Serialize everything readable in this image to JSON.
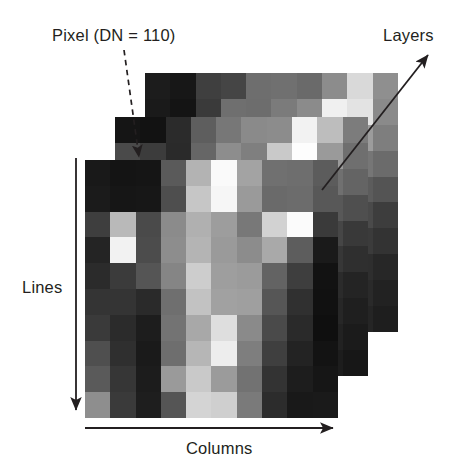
{
  "figure": {
    "type": "diagram",
    "background_color": "#ffffff",
    "text_color": "#231f20"
  },
  "labels": {
    "pixel": "Pixel (DN = 110)",
    "layers": "Layers",
    "lines": "Lines",
    "columns": "Columns"
  },
  "annotations": [
    {
      "name": "pixel-callout",
      "label": "Pixel (DN = 110)",
      "style": "dashed-arrow",
      "from": [
        124,
        50
      ],
      "to": [
        141,
        166
      ],
      "color": "#231f20"
    },
    {
      "name": "layers-callout",
      "label": "Layers",
      "style": "solid-double-arrow",
      "from": [
        322,
        189
      ],
      "to": [
        432,
        52
      ],
      "color": "#231f20"
    },
    {
      "name": "lines-axis",
      "label": "Lines",
      "style": "solid-arrow-down",
      "from": [
        76,
        159
      ],
      "to": [
        76,
        414
      ],
      "color": "#231f20"
    },
    {
      "name": "columns-axis",
      "label": "Columns",
      "style": "solid-arrow-right",
      "from": [
        85,
        428
      ],
      "to": [
        338,
        428
      ],
      "color": "#231f20"
    }
  ],
  "stack": {
    "layer_count": 3,
    "offset_x": -30,
    "offset_y": 43,
    "grid": {
      "rows": 10,
      "cols": 10
    },
    "cell_size_px": 25.3,
    "layers": [
      {
        "name": "layer-back",
        "z": 1,
        "rows": [
          [
            "#1c1c1c",
            "#171717",
            "#3f3f3f",
            "#454545",
            "#6e6e6e",
            "#707070",
            "#6a6a6a",
            "#8c8c8c",
            "#d9d9d9",
            "#8f8f8f"
          ],
          [
            "#1a1a1a",
            "#141414",
            "#3a3a3a",
            "#6f6f6f",
            "#6d6d6d",
            "#7b7b7b",
            "#8b8b8b",
            "#f0f0f0",
            "#e3e3e3",
            "#8a8a8a"
          ],
          [
            "#4a4a4a",
            "#3b3b3b",
            "#2f2f2f",
            "#6b6b6b",
            "#8e8e8e",
            "#7a7a7a",
            "#b5b5b5",
            "#fbfbfb",
            "#9c9c9c",
            "#7e7e7e"
          ],
          [
            "#3b3b3b",
            "#2e2e2e",
            "#555555",
            "#6a6a6a",
            "#8d8d8d",
            "#a6a6a6",
            "#9b9b9b",
            "#8e8e8e",
            "#767676",
            "#6b6b6b"
          ],
          [
            "#2a2a2a",
            "#3f3f3f",
            "#686868",
            "#8a8a8a",
            "#9e9e9e",
            "#b2b2b2",
            "#7d7d7d",
            "#6e6e6e",
            "#5c5c5c",
            "#545454"
          ],
          [
            "#1f1f1f",
            "#343434",
            "#5a5a5a",
            "#7d7d7d",
            "#a9a9a9",
            "#8e8e8e",
            "#6b6b6b",
            "#585858",
            "#4a4a4a",
            "#3d3d3d"
          ],
          [
            "#2d2d2d",
            "#4a4a4a",
            "#6d6d6d",
            "#8f8f8f",
            "#9a9a9a",
            "#7c7c7c",
            "#5e5e5e",
            "#4d4d4d",
            "#3b3b3b",
            "#333333"
          ],
          [
            "#3a3a3a",
            "#5c5c5c",
            "#7e7e7e",
            "#a0a0a0",
            "#8c8c8c",
            "#6a6a6a",
            "#4f4f4f",
            "#404040",
            "#2e2e2e",
            "#272727"
          ],
          [
            "#4d4d4d",
            "#6f6f6f",
            "#8b8b8b",
            "#959595",
            "#7a7a7a",
            "#5b5b5b",
            "#454545",
            "#373737",
            "#2a2a2a",
            "#222222"
          ],
          [
            "#5e5e5e",
            "#7d7d7d",
            "#969696",
            "#868686",
            "#6b6b6b",
            "#4e4e4e",
            "#3c3c3c",
            "#2f2f2f",
            "#252525",
            "#1e1e1e"
          ]
        ]
      },
      {
        "name": "layer-mid",
        "z": 2,
        "rows": [
          [
            "#151515",
            "#121212",
            "#2b2b2b",
            "#5e5e5e",
            "#777777",
            "#8a8a8a",
            "#8c8c8c",
            "#f2f2f2",
            "#bdbdbd",
            "#7c7c7c"
          ],
          [
            "#4a4a4a",
            "#3c3c3c",
            "#2a2a2a",
            "#666666",
            "#8d8d8d",
            "#7f7f7f",
            "#c9c9c9",
            "#fdfdfd",
            "#9a9a9a",
            "#6f6f6f"
          ],
          [
            "#3e3e3e",
            "#333333",
            "#4f4f4f",
            "#707070",
            "#949494",
            "#a8a8a8",
            "#8e8e8e",
            "#8a8a8a",
            "#707070",
            "#646464"
          ],
          [
            "#2c2c2c",
            "#414141",
            "#6b6b6b",
            "#8f8f8f",
            "#a2a2a2",
            "#b6b6b6",
            "#7a7a7a",
            "#6a6a6a",
            "#585858",
            "#4f4f4f"
          ],
          [
            "#212121",
            "#363636",
            "#5d5d5d",
            "#808080",
            "#adadad",
            "#919191",
            "#696969",
            "#555555",
            "#464646",
            "#393939"
          ],
          [
            "#2f2f2f",
            "#4d4d4d",
            "#707070",
            "#929292",
            "#9d9d9d",
            "#7f7f7f",
            "#5b5b5b",
            "#4a4a4a",
            "#373737",
            "#2f2f2f"
          ],
          [
            "#3c3c3c",
            "#5f5f5f",
            "#818181",
            "#a3a3a3",
            "#8f8f8f",
            "#6d6d6d",
            "#4c4c4c",
            "#3d3d3d",
            "#2b2b2b",
            "#242424"
          ],
          [
            "#4f4f4f",
            "#727272",
            "#8e8e8e",
            "#989898",
            "#7d7d7d",
            "#5e5e5e",
            "#424242",
            "#343434",
            "#272727",
            "#1f1f1f"
          ],
          [
            "#606060",
            "#808080",
            "#999999",
            "#898989",
            "#6e6e6e",
            "#515151",
            "#393939",
            "#2c2c2c",
            "#222222",
            "#1b1b1b"
          ],
          [
            "#6e6e6e",
            "#8c8c8c",
            "#8e8e8e",
            "#767676",
            "#5c5c5c",
            "#434343",
            "#313131",
            "#262626",
            "#1d1d1d",
            "#171717"
          ]
        ]
      },
      {
        "name": "layer-front",
        "z": 3,
        "rows": [
          [
            "#191919",
            "#141414",
            "#151515",
            "#5a5a5a",
            "#b3b3b3",
            "#fafafa",
            "#a3a3a3",
            "#707070",
            "#6e6e6e",
            "#5c5c5c"
          ],
          [
            "#1b1b1b",
            "#161616",
            "#171717",
            "#4e4e4e",
            "#c6c6c6",
            "#f6f6f6",
            "#9a9a9a",
            "#6a6a6a",
            "#6c6c6c",
            "#585858"
          ],
          [
            "#3e3e3e",
            "#b9b9b9",
            "#4a4a4a",
            "#8b8b8b",
            "#b0b0b0",
            "#9d9d9d",
            "#787878",
            "#d2d2d2",
            "#fbfbfb",
            "#3a3a3a"
          ],
          [
            "#242424",
            "#f2f2f2",
            "#4c4c4c",
            "#8d8d8d",
            "#b4b4b4",
            "#9a9a9a",
            "#8c8c8c",
            "#a9a9a9",
            "#5d5d5d",
            "#1a1a1a"
          ],
          [
            "#2b2b2b",
            "#3b3b3b",
            "#555555",
            "#858585",
            "#cdcdcd",
            "#9e9e9e",
            "#9b9b9b",
            "#636363",
            "#3e3e3e",
            "#121212"
          ],
          [
            "#343434",
            "#343434",
            "#2a2a2a",
            "#6f6f6f",
            "#c2c2c2",
            "#a1a1a1",
            "#9f9f9f",
            "#565656",
            "#303030",
            "#111111"
          ],
          [
            "#3a3a3a",
            "#2b2b2b",
            "#1d1d1d",
            "#737373",
            "#a8a8a8",
            "#dedede",
            "#8a8a8a",
            "#4a4a4a",
            "#2a2a2a",
            "#0f0f0f"
          ],
          [
            "#4f4f4f",
            "#2f2f2f",
            "#1a1a1a",
            "#6e6e6e",
            "#b6b6b6",
            "#ededed",
            "#7e7e7e",
            "#3f3f3f",
            "#232323",
            "#131313"
          ],
          [
            "#5a5a5a",
            "#363636",
            "#1c1c1c",
            "#9a9a9a",
            "#c9c9c9",
            "#9b9b9b",
            "#727272",
            "#333333",
            "#1d1d1d",
            "#161616"
          ],
          [
            "#8e8e8e",
            "#3a3a3a",
            "#1e1e1e",
            "#555555",
            "#d4d4d4",
            "#cfcfcf",
            "#7a7a7a",
            "#2c2c2c",
            "#191919",
            "#1a1a1a"
          ]
        ]
      }
    ]
  }
}
